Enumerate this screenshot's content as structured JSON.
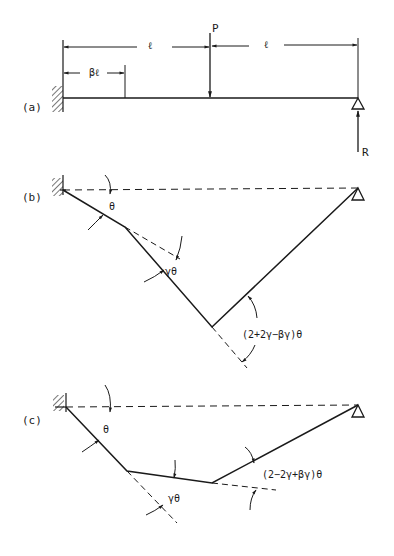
{
  "panels": {
    "a": {
      "label": "(a)",
      "load_label": "P",
      "reaction_label": "R",
      "span_left_label": "ℓ",
      "span_right_label": "ℓ",
      "hinge_offset_label": "βℓ"
    },
    "b": {
      "label": "(b)",
      "theta_label": "θ",
      "gamma_theta_label": "γθ",
      "angle_label": "(2+2γ−βγ)θ"
    },
    "c": {
      "label": "(c)",
      "theta_label": "θ",
      "gamma_theta_label": "γθ",
      "angle_label": "(2−2γ+βγ)θ"
    }
  },
  "colors": {
    "ink": "#1a1a1a",
    "background": "#ffffff"
  }
}
